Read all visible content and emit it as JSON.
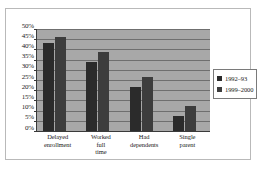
{
  "chart_data": {
    "type": "bar",
    "title": "",
    "subtitle": "",
    "xlabel": "",
    "ylabel": "",
    "categories": [
      "Delayed enrollment",
      "Worked full time",
      "Had dependents",
      "Single parent"
    ],
    "category_lines": [
      [
        "Delayed",
        "enrollment"
      ],
      [
        "Worked",
        "full",
        "time"
      ],
      [
        "Had",
        "dependents"
      ],
      [
        "Single",
        "parent"
      ]
    ],
    "series": [
      {
        "name": "1992–93",
        "values": [
          43,
          34,
          21.5,
          7.5
        ],
        "color": "#2b2b2b"
      },
      {
        "name": "1999–2000",
        "values": [
          46,
          38.5,
          26.5,
          12.5
        ],
        "color": "#3d3d3d"
      }
    ],
    "ylim": [
      0,
      50
    ],
    "ytick_step": 5,
    "ytick_labels": [
      "50%",
      "45%",
      "40%",
      "35%",
      "30%",
      "25%",
      "20%",
      "15%",
      "10%",
      "5%",
      "0%"
    ],
    "ytick_values": [
      50,
      45,
      40,
      35,
      30,
      25,
      20,
      15,
      10,
      5,
      0
    ],
    "grid": true,
    "grid_orientation": "horizontal",
    "legend_position": "right",
    "plot_background": "#a8a8a8",
    "figure_background": "#ffffff",
    "axis_color": "#3a3a3a",
    "gridline_color": "#6f6f6f"
  },
  "legend": {
    "entries": [
      {
        "label": "1992–93"
      },
      {
        "label": "1999–2000"
      }
    ]
  }
}
